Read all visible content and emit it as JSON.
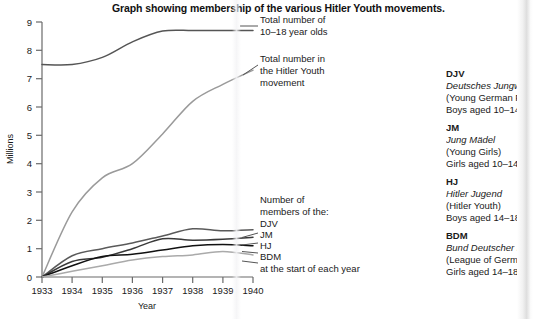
{
  "title": "Graph showing membership of the various Hitler Youth movements.",
  "chart_data": {
    "type": "line",
    "title": "Graph showing membership of the various Hitler Youth movements.",
    "xlabel": "Year",
    "ylabel": "Millions",
    "xlim": [
      1933,
      1940
    ],
    "ylim": [
      0,
      9
    ],
    "xticks": [
      "1933",
      "1934",
      "1935",
      "1936",
      "1937",
      "1938",
      "1939",
      "1940"
    ],
    "yticks": [
      "0",
      "1",
      "2",
      "3",
      "4",
      "5",
      "6",
      "7",
      "8",
      "9"
    ],
    "grid": false,
    "legend_position": "in-plot-right",
    "x": [
      1933,
      1934,
      1935,
      1936,
      1937,
      1938,
      1939,
      1940
    ],
    "series": [
      {
        "name": "Total number of 10-18 year olds",
        "color": "#555555",
        "values": [
          7.5,
          7.5,
          7.75,
          8.3,
          8.68,
          8.7,
          8.7,
          8.7
        ]
      },
      {
        "name": "Total number in the Hitler Youth movement",
        "color": "#9a9a9a",
        "values": [
          0.0,
          2.3,
          3.5,
          4.0,
          5.05,
          6.2,
          6.8,
          7.3
        ]
      },
      {
        "name": "DJV",
        "color": "#5a5a5a",
        "values": [
          0.0,
          0.75,
          1.0,
          1.2,
          1.45,
          1.7,
          1.63,
          1.67
        ]
      },
      {
        "name": "JM",
        "color": "#3a3a3a",
        "values": [
          0.0,
          0.55,
          0.7,
          1.0,
          1.35,
          1.3,
          1.33,
          1.4
        ]
      },
      {
        "name": "HJ",
        "color": "#111111",
        "values": [
          0.0,
          0.4,
          0.72,
          0.8,
          0.95,
          1.1,
          1.15,
          1.1
        ]
      },
      {
        "name": "BDM",
        "color": "#aaaaaa",
        "values": [
          0.0,
          0.2,
          0.4,
          0.6,
          0.72,
          0.78,
          0.9,
          0.78
        ]
      }
    ],
    "annotations": [
      {
        "name": "total-10-18-label",
        "lines": [
          "Total number of",
          "10–18 year olds"
        ]
      },
      {
        "name": "total-hitler-youth-label",
        "lines": [
          "Total number in",
          "the Hitler Youth",
          "movement"
        ]
      },
      {
        "name": "members-label",
        "lines": [
          "Number of",
          "members of the:"
        ]
      },
      {
        "name": "series-key",
        "lines": [
          "DJV",
          "JM",
          "HJ",
          "BDM"
        ]
      },
      {
        "name": "start-of-year-note",
        "lines": [
          "at the start of each year"
        ]
      }
    ]
  },
  "legend": {
    "groups": [
      {
        "abbr": "DJV",
        "german": "Deutsches Jungw",
        "english": "(Young German F",
        "ages": "Boys aged 10–14"
      },
      {
        "abbr": "JM",
        "german": "Jung Mädel",
        "english": "(Young Girls)",
        "ages": "Girls aged 10–14"
      },
      {
        "abbr": "HJ",
        "german": "Hitler Jugend",
        "english": "(Hitler Youth)",
        "ages": "Boys aged 14–18"
      },
      {
        "abbr": "BDM",
        "german": "Bund Deutscher I",
        "english": "(League of Germa",
        "ages": "Girls aged 14–18"
      }
    ]
  }
}
